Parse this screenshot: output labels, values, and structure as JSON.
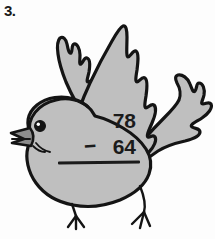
{
  "worksheet": {
    "item_number": "3."
  },
  "problem": {
    "minuend": "78",
    "operator": "−",
    "subtrahend": "64",
    "answer": ""
  },
  "illustration": {
    "subject": "bird",
    "name": "flying-bird-illustration",
    "fill_color": "#bfbfbf",
    "outline_color": "#141414",
    "beak_color": "#8d8d8d",
    "eye_color": "#141414",
    "highlight_color": "#ffffff",
    "background_color": "#fdfdfd",
    "parts": [
      "left-wing",
      "right-wing",
      "tail",
      "body",
      "head",
      "beak",
      "eye",
      "left-leg",
      "right-leg"
    ]
  }
}
